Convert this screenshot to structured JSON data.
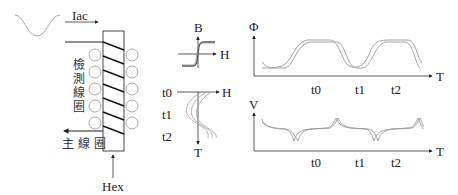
{
  "coil_diagram": {
    "current_label": "Iac",
    "detect_coil_label": "檢測線圈",
    "main_coil_label": "主線圈",
    "field_label": "Hex"
  },
  "bh_plot": {
    "y_axis_label": "B",
    "x_axis_label": "H"
  },
  "ht_plot": {
    "x_axis_label": "H",
    "y_axis_label": "T",
    "time_labels": [
      "t0",
      "t1",
      "t2"
    ]
  },
  "flux_plot": {
    "y_axis_label": "Φ",
    "x_axis_label": "T",
    "time_labels": [
      "t0",
      "t1",
      "t2"
    ]
  },
  "voltage_plot": {
    "y_axis_label": "V",
    "x_axis_label": "T",
    "time_labels": [
      "t0",
      "t1",
      "t2"
    ]
  },
  "colors": {
    "line_dark": "#222222",
    "curve_gray": "#9a9a9a",
    "circle_gray": "#a0a0a0"
  }
}
